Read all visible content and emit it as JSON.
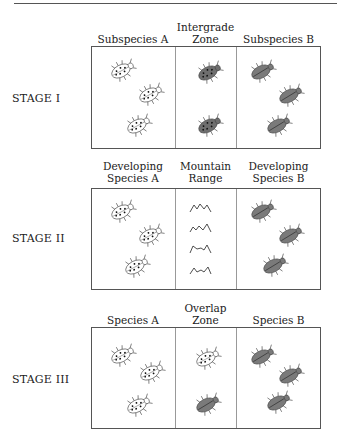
{
  "stages": [
    {
      "label": "STAGE I",
      "columns": [
        {
          "header": [
            "",
            "Subspecies A"
          ],
          "content": [
            "spotted",
            "spotted",
            "spotted"
          ]
        },
        {
          "header": [
            "Intergrade",
            "Zone"
          ],
          "content": [
            "intergrade",
            "intergrade"
          ]
        },
        {
          "header": [
            "",
            "Subspecies B"
          ],
          "content": [
            "striped",
            "striped",
            "striped"
          ]
        }
      ]
    },
    {
      "label": "STAGE II",
      "columns": [
        {
          "header": [
            "Developing",
            "Species A"
          ],
          "content": [
            "spotted",
            "spotted",
            "spotted"
          ]
        },
        {
          "header": [
            "Mountain",
            "Range"
          ],
          "content": [
            "mountain",
            "mountain",
            "mountain",
            "mountain"
          ]
        },
        {
          "header": [
            "Developing",
            "Species B"
          ],
          "content": [
            "striped",
            "striped",
            "striped"
          ]
        }
      ]
    },
    {
      "label": "STAGE III",
      "columns": [
        {
          "header": [
            "",
            "Species A"
          ],
          "content": [
            "spotted",
            "spotted",
            "spotted"
          ]
        },
        {
          "header": [
            "Overlap",
            "Zone"
          ],
          "content": [
            "spotted",
            "striped"
          ]
        },
        {
          "header": [
            "",
            "Species B"
          ],
          "content": [
            "striped",
            "striped",
            "striped"
          ]
        }
      ]
    }
  ],
  "colors": {
    "spotted_fill": "#ffffff",
    "intergrade_fill": "#6e6e6e",
    "striped_fill": "#7a7a7a",
    "outline": "#444444"
  }
}
